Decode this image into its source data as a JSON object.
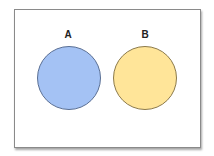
{
  "diagram": {
    "type": "venn",
    "sets": [
      {
        "label": "A",
        "fill": "#a4c2f4",
        "stroke": "#5a6f94"
      },
      {
        "label": "B",
        "fill": "#ffe599",
        "stroke": "#8c7a4a"
      }
    ],
    "overlap": false
  }
}
